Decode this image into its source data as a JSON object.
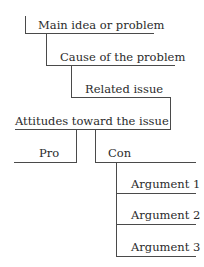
{
  "diagram": {
    "type": "tree-outline",
    "line_color": "#4a4a4a",
    "text_color": "#2b2b2b",
    "nodes": {
      "main": {
        "label": "Main idea or problem"
      },
      "cause": {
        "label": "Cause of the problem"
      },
      "related": {
        "label": "Related issue"
      },
      "attitudes": {
        "label": "Attitudes toward the issue"
      },
      "pro": {
        "label": "Pro"
      },
      "con": {
        "label": "Con"
      },
      "arguments": [
        {
          "label": "Argument 1"
        },
        {
          "label": "Argument 2"
        },
        {
          "label": "Argument 3"
        }
      ]
    },
    "edges": [
      [
        "main",
        "cause"
      ],
      [
        "cause",
        "related"
      ],
      [
        "related",
        "attitudes"
      ],
      [
        "attitudes",
        "pro"
      ],
      [
        "attitudes",
        "con"
      ],
      [
        "con",
        "Argument 1"
      ],
      [
        "con",
        "Argument 2"
      ],
      [
        "con",
        "Argument 3"
      ]
    ]
  }
}
